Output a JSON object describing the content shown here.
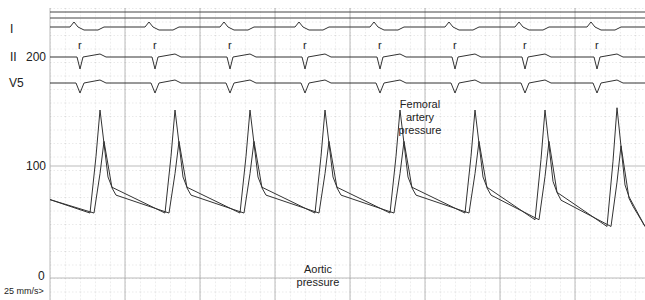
{
  "chart_data": {
    "type": "line",
    "title": "",
    "leads": [
      "I",
      "II",
      "V5"
    ],
    "y_axis": {
      "ticks": [
        0,
        100,
        200
      ],
      "unit": "mmHg",
      "ylim": [
        0,
        200
      ]
    },
    "paper_speed": "25 mm/s>",
    "r_wave_label": "r",
    "beat_count": 8,
    "r_wave_x_px": [
      80,
      155,
      230,
      305,
      380,
      455,
      525,
      597
    ],
    "series": [
      {
        "name": "Femoral artery pressure",
        "systolic_peaks": [
          150,
          150,
          150,
          150,
          150,
          150,
          150,
          152
        ],
        "diastolic": [
          58,
          58,
          58,
          58,
          58,
          58,
          52,
          46
        ]
      },
      {
        "name": "Aortic pressure",
        "systolic_peaks": [
          122,
          122,
          122,
          122,
          122,
          122,
          122,
          118
        ],
        "diastolic": [
          58,
          58,
          58,
          58,
          58,
          58,
          52,
          46
        ]
      }
    ],
    "annotations": [
      {
        "text": "Femoral artery pressure",
        "x_px": 420,
        "y_px": 105
      },
      {
        "text": "Aortic pressure",
        "x_px": 318,
        "y_px": 270
      }
    ],
    "grid": true
  },
  "labels": {
    "lead_I": "I",
    "lead_II": "II",
    "lead_V5": "V5",
    "tick_200": "200",
    "tick_100": "100",
    "tick_0": "0",
    "speed": "25 mm/s>",
    "femoral_line1": "Femoral",
    "femoral_line2": "artery",
    "femoral_line3": "pressure",
    "aortic_line1": "Aortic",
    "aortic_line2": "pressure"
  }
}
